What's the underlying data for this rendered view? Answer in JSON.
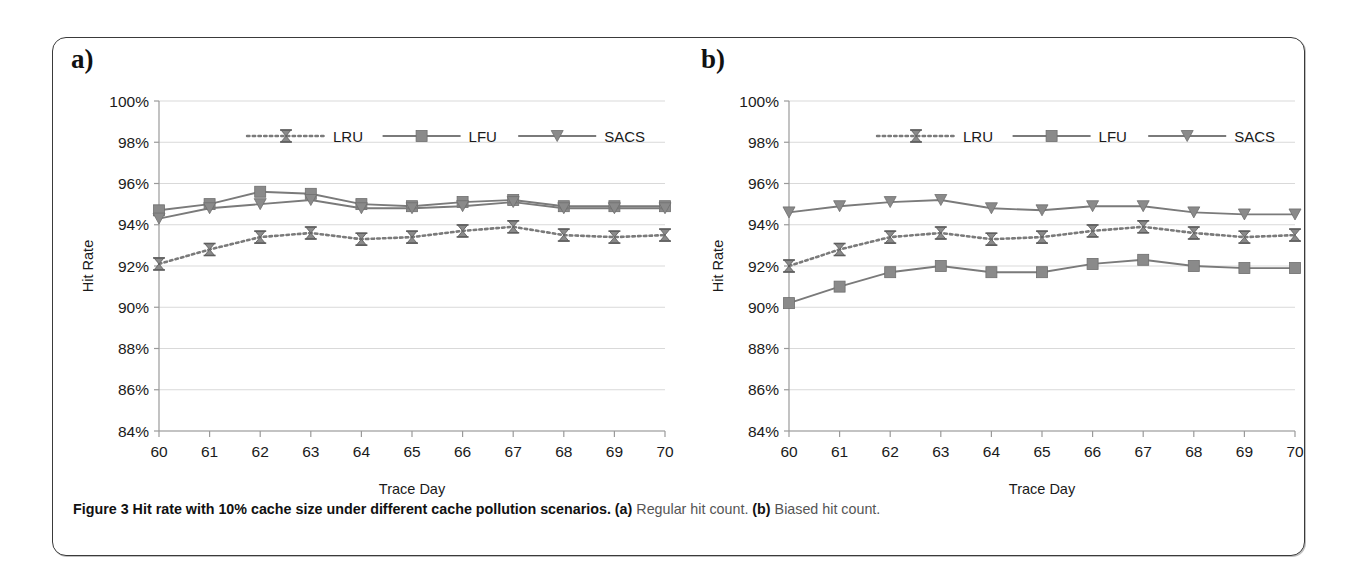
{
  "figure": {
    "caption_prefix": "Figure 3",
    "caption_main": " Hit rate with 10% cache size under different cache pollution scenarios. ",
    "caption_a_label": "(a)",
    "caption_a_text": " Regular hit count. ",
    "caption_b_label": "(b)",
    "caption_b_text": " Biased hit count.",
    "panel_a_label": "a)",
    "panel_b_label": "b)"
  },
  "style": {
    "line_color": "#7a7a7a",
    "marker_color": "#8a8a8a",
    "grid_color": "#d9d9d9",
    "axis_color": "#9a9a9a",
    "text_color": "#1a1a1a"
  },
  "chart_data": [
    {
      "type": "line",
      "panel": "a",
      "title": "Regular hit count",
      "xlabel": "Trace Day",
      "ylabel": "Hit Rate",
      "x": [
        60,
        61,
        62,
        63,
        64,
        65,
        66,
        67,
        68,
        69,
        70
      ],
      "xticklabels": [
        "60",
        "61",
        "62",
        "63",
        "64",
        "65",
        "66",
        "67",
        "68",
        "69",
        "70"
      ],
      "yticklabels": [
        "84%",
        "86%",
        "88%",
        "90%",
        "92%",
        "94%",
        "96%",
        "98%",
        "100%"
      ],
      "ytickvalues": [
        84,
        86,
        88,
        90,
        92,
        94,
        96,
        98,
        100
      ],
      "ylim": [
        84,
        100
      ],
      "xlim": [
        60,
        70
      ],
      "grid": true,
      "legend_position": "top-center",
      "series": [
        {
          "name": "LRU",
          "marker": "x-hourglass",
          "linestyle": "dotted",
          "values": [
            92.1,
            92.8,
            93.4,
            93.6,
            93.3,
            93.4,
            93.7,
            93.9,
            93.5,
            93.4,
            93.5
          ]
        },
        {
          "name": "LFU",
          "marker": "square",
          "linestyle": "solid",
          "values": [
            94.7,
            95.0,
            95.6,
            95.5,
            95.0,
            94.9,
            95.1,
            95.2,
            94.9,
            94.9,
            94.9
          ]
        },
        {
          "name": "SACS",
          "marker": "triangle-down",
          "linestyle": "solid",
          "values": [
            94.3,
            94.8,
            95.0,
            95.2,
            94.8,
            94.8,
            94.9,
            95.1,
            94.8,
            94.8,
            94.8
          ]
        }
      ]
    },
    {
      "type": "line",
      "panel": "b",
      "title": "Biased hit count",
      "xlabel": "Trace Day",
      "ylabel": "Hit Rate",
      "x": [
        60,
        61,
        62,
        63,
        64,
        65,
        66,
        67,
        68,
        69,
        70
      ],
      "xticklabels": [
        "60",
        "61",
        "62",
        "63",
        "64",
        "65",
        "66",
        "67",
        "68",
        "69",
        "70"
      ],
      "yticklabels": [
        "84%",
        "86%",
        "88%",
        "90%",
        "92%",
        "94%",
        "96%",
        "98%",
        "100%"
      ],
      "ytickvalues": [
        84,
        86,
        88,
        90,
        92,
        94,
        96,
        98,
        100
      ],
      "ylim": [
        84,
        100
      ],
      "xlim": [
        60,
        70
      ],
      "grid": true,
      "legend_position": "top-center",
      "series": [
        {
          "name": "LRU",
          "marker": "x-hourglass",
          "linestyle": "dotted",
          "values": [
            92.0,
            92.8,
            93.4,
            93.6,
            93.3,
            93.4,
            93.7,
            93.9,
            93.6,
            93.4,
            93.5
          ]
        },
        {
          "name": "LFU",
          "marker": "square",
          "linestyle": "solid",
          "values": [
            90.2,
            91.0,
            91.7,
            92.0,
            91.7,
            91.7,
            92.1,
            92.3,
            92.0,
            91.9,
            91.9
          ]
        },
        {
          "name": "SACS",
          "marker": "triangle-down",
          "linestyle": "solid",
          "values": [
            94.6,
            94.9,
            95.1,
            95.2,
            94.8,
            94.7,
            94.9,
            94.9,
            94.6,
            94.5,
            94.5
          ]
        }
      ]
    }
  ]
}
